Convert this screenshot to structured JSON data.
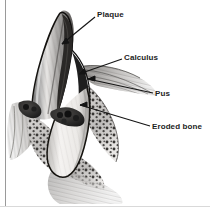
{
  "figure": {
    "background_color": "#ffffff",
    "border_color": "#9a9a9a",
    "label_color": "#1d1d1d"
  },
  "labels": [
    {
      "id": "plaque",
      "text": "Plaque",
      "x": 97,
      "y": 10
    },
    {
      "id": "calculus",
      "text": "Calculus",
      "x": 124,
      "y": 53
    },
    {
      "id": "pus",
      "text": "Pus",
      "x": 155,
      "y": 89
    },
    {
      "id": "eroded",
      "text": "Eroded bone",
      "x": 152,
      "y": 122
    }
  ],
  "leader_lines": [
    {
      "id": "plaque",
      "from_x": 95,
      "from_y": 17,
      "to_x": 59,
      "to_y": 46
    },
    {
      "id": "calculus",
      "from_x": 122,
      "from_y": 59,
      "to_x": 76,
      "to_y": 75
    },
    {
      "id": "pus",
      "from_x": 153,
      "from_y": 93,
      "to_x": 86,
      "to_y": 79
    },
    {
      "id": "eroded",
      "from_x": 150,
      "from_y": 126,
      "to_x": 78,
      "to_y": 107
    }
  ],
  "anatomy": {
    "crown": {
      "name": "tooth-crown",
      "fill": "#8d8d8d",
      "outline": "#1b1b1b"
    },
    "root": {
      "name": "tooth-root",
      "fill": "#f2f0ee",
      "outline": "#1b1b1b"
    },
    "plaque_band": {
      "name": "plaque-deposit",
      "fill": "#2a2a2a"
    },
    "calculus_deposit": {
      "name": "calculus-deposit",
      "fill": "#242424"
    },
    "gingiva": {
      "name": "gingival-tissue",
      "fill": "#b9b9b9"
    },
    "bone": {
      "name": "eroded-alveolar-bone",
      "fill": "#c6c4c2",
      "stipple": "#3a3a3a"
    },
    "pocket": {
      "name": "periodontal-pocket",
      "fill": "#1e1e1e"
    }
  },
  "palette": {
    "ink": "#1b1b1b",
    "mid_gray": "#8d8d8d",
    "light_gray": "#d8d6d4",
    "bone_gray": "#c6c4c2",
    "white": "#ffffff"
  }
}
